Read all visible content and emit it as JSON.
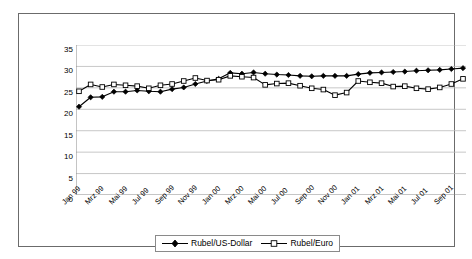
{
  "chart_data": {
    "type": "line",
    "title": "",
    "subtitle": "",
    "xlabel": "",
    "ylabel": "",
    "ylim": [
      0,
      35
    ],
    "ytick_step": 5,
    "yticks": [
      "0",
      "5",
      "10",
      "15",
      "20",
      "25",
      "30",
      "35"
    ],
    "grid": "horizontal",
    "legend_position": "bottom-center",
    "x": [
      "Jan 99",
      "Feb 99",
      "Mrz 99",
      "Apr 99",
      "Mai 99",
      "Jun 99",
      "Jul 99",
      "Aug 99",
      "Sep 99",
      "Okt 99",
      "Nov 99",
      "Dez 99",
      "Jan 00",
      "Feb 00",
      "Mrz 00",
      "Apr 00",
      "Mai 00",
      "Jun 00",
      "Jul 00",
      "Aug 00",
      "Sep 00",
      "Okt 00",
      "Nov 00",
      "Dez 00",
      "Jan 01",
      "Feb 01",
      "Mrz 01",
      "Apr 01",
      "Mai 01",
      "Jun 01",
      "Jul 01",
      "Aug 01",
      "Sep 01",
      "Okt 01"
    ],
    "xtick_labels": [
      "Jan 99",
      "Mrz 99",
      "Mai 99",
      "Jul 99",
      "Sep 99",
      "Nov 99",
      "Jan 00",
      "Mrz 00",
      "Mai 00",
      "Jul 00",
      "Sep 00",
      "Nov 00",
      "Jan 01",
      "Mrz 01",
      "Mai 01",
      "Jul 01",
      "Sep 01"
    ],
    "xtick_every": 2,
    "series": [
      {
        "name": "Rubel/US-Dollar",
        "marker": "filled-diamond",
        "color": "#000000",
        "values": [
          20.6,
          22.8,
          22.9,
          24.1,
          24.1,
          24.4,
          24.2,
          24.1,
          24.7,
          25.1,
          25.9,
          26.6,
          27.1,
          28.5,
          28.3,
          28.6,
          28.3,
          28.1,
          28.0,
          27.8,
          27.7,
          27.8,
          27.8,
          27.8,
          28.2,
          28.5,
          28.6,
          28.7,
          28.8,
          29.0,
          29.1,
          29.2,
          29.4,
          29.6
        ]
      },
      {
        "name": "Rubel/Euro",
        "marker": "open-square",
        "color": "#000000",
        "values": [
          24.2,
          25.8,
          25.2,
          25.8,
          25.6,
          25.4,
          24.9,
          25.6,
          25.9,
          26.6,
          27.3,
          26.7,
          26.9,
          27.8,
          27.6,
          27.4,
          25.7,
          26.0,
          26.1,
          25.5,
          24.9,
          24.6,
          23.3,
          23.9,
          26.6,
          26.3,
          26.1,
          25.3,
          25.4,
          24.9,
          24.7,
          25.1,
          25.9,
          27.1
        ]
      }
    ]
  },
  "legend": {
    "items": [
      {
        "label": "Rubel/US-Dollar",
        "marker": "filled-diamond"
      },
      {
        "label": "Rubel/Euro",
        "marker": "open-square"
      }
    ]
  }
}
